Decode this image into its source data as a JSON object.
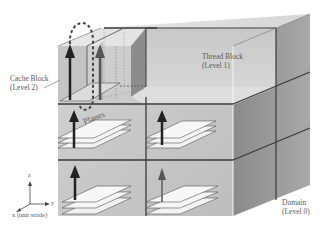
{
  "diagram": {
    "type": "3D domain decomposition cube",
    "labels": {
      "cache_block": {
        "line1": "Cache Block",
        "line2": "(Level 2)"
      },
      "thread_block": {
        "line1": "Thread Block",
        "line2": "(Level 1)"
      },
      "domain": {
        "line1": "Domain",
        "line2": "(Level 0)"
      },
      "planes": "Planes"
    },
    "axes": {
      "z": "z",
      "y": "y",
      "x": "x (unit stride)"
    },
    "colors": {
      "front_face": "#c9c9c9",
      "top_face": "#e2e2e2",
      "right_face": "#8f8f8f",
      "edge": "#3a3a3a",
      "arrow": "#2a2a2a",
      "plane": "#f2f2f2"
    }
  }
}
